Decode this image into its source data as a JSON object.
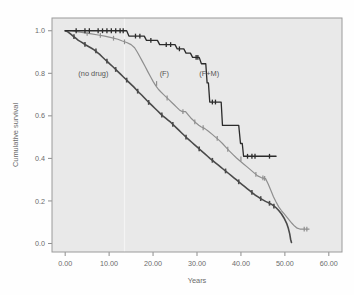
{
  "figure": {
    "background_color": "#fefefe",
    "plot_background_color": "#e9e9e9",
    "plot_border_color": "#9a9a9a"
  },
  "chart_data": {
    "type": "line",
    "title": "",
    "subtitle": "",
    "xlabel": "Years",
    "ylabel": "Cumulative survival",
    "xlim": [
      -3.0,
      63.0
    ],
    "ylim": [
      -0.04,
      1.06
    ],
    "grid": false,
    "legend_position": "inline-annotations",
    "xticks": [
      0,
      10,
      20,
      30,
      40,
      50,
      60
    ],
    "xtick_labels": [
      "0.00",
      "10.00",
      "20.00",
      "30.00",
      "40.00",
      "50.00",
      "60.00"
    ],
    "yticks": [
      0.0,
      0.2,
      0.4,
      0.6,
      0.8,
      1.0
    ],
    "ytick_labels": [
      "0.0",
      "0.2",
      "0.4",
      "0.6",
      "0.8",
      "1.0"
    ],
    "annotations": [
      {
        "text": "(no drug)",
        "x": 3.0,
        "y": 0.8,
        "color": "#555555"
      },
      {
        "text": "(F)",
        "x": 21.5,
        "y": 0.8,
        "color": "#555555"
      },
      {
        "text": "(F+M)",
        "x": 30.5,
        "y": 0.8,
        "color": "#555555"
      }
    ],
    "series": [
      {
        "name": "no drug",
        "label": "(no drug)",
        "color": "#4a4a4a",
        "line_width": 1.6,
        "censor_marks": true,
        "points": [
          [
            0.0,
            1.0
          ],
          [
            0.6,
            0.995
          ],
          [
            1.2,
            0.985
          ],
          [
            1.8,
            0.975
          ],
          [
            2.4,
            0.965
          ],
          [
            3.0,
            0.955
          ],
          [
            3.6,
            0.948
          ],
          [
            4.2,
            0.94
          ],
          [
            4.8,
            0.932
          ],
          [
            5.4,
            0.925
          ],
          [
            6.0,
            0.918
          ],
          [
            6.6,
            0.91
          ],
          [
            7.2,
            0.9
          ],
          [
            7.8,
            0.89
          ],
          [
            8.4,
            0.878
          ],
          [
            9.0,
            0.866
          ],
          [
            9.6,
            0.855
          ],
          [
            10.2,
            0.843
          ],
          [
            10.8,
            0.832
          ],
          [
            11.4,
            0.82
          ],
          [
            12.0,
            0.808
          ],
          [
            12.6,
            0.796
          ],
          [
            13.2,
            0.784
          ],
          [
            13.8,
            0.772
          ],
          [
            14.4,
            0.76
          ],
          [
            15.0,
            0.748
          ],
          [
            15.6,
            0.736
          ],
          [
            16.2,
            0.723
          ],
          [
            16.8,
            0.71
          ],
          [
            17.4,
            0.698
          ],
          [
            18.0,
            0.685
          ],
          [
            18.6,
            0.672
          ],
          [
            19.2,
            0.66
          ],
          [
            19.8,
            0.648
          ],
          [
            20.4,
            0.636
          ],
          [
            21.0,
            0.624
          ],
          [
            21.6,
            0.612
          ],
          [
            22.2,
            0.6
          ],
          [
            22.8,
            0.59
          ],
          [
            23.4,
            0.58
          ],
          [
            24.0,
            0.57
          ],
          [
            24.6,
            0.558
          ],
          [
            25.2,
            0.546
          ],
          [
            25.8,
            0.534
          ],
          [
            26.4,
            0.522
          ],
          [
            27.0,
            0.51
          ],
          [
            27.6,
            0.498
          ],
          [
            28.2,
            0.487
          ],
          [
            28.8,
            0.476
          ],
          [
            29.4,
            0.465
          ],
          [
            30.0,
            0.454
          ],
          [
            30.6,
            0.443
          ],
          [
            31.2,
            0.432
          ],
          [
            31.8,
            0.421
          ],
          [
            32.4,
            0.41
          ],
          [
            33.0,
            0.399
          ],
          [
            33.6,
            0.389
          ],
          [
            34.2,
            0.379
          ],
          [
            34.8,
            0.369
          ],
          [
            35.4,
            0.359
          ],
          [
            36.0,
            0.349
          ],
          [
            36.6,
            0.339
          ],
          [
            37.2,
            0.329
          ],
          [
            37.8,
            0.319
          ],
          [
            38.4,
            0.309
          ],
          [
            39.0,
            0.299
          ],
          [
            39.6,
            0.288
          ],
          [
            40.2,
            0.278
          ],
          [
            40.8,
            0.268
          ],
          [
            41.4,
            0.258
          ],
          [
            42.0,
            0.248
          ],
          [
            42.6,
            0.238
          ],
          [
            43.2,
            0.228
          ],
          [
            43.8,
            0.22
          ],
          [
            44.4,
            0.212
          ],
          [
            45.0,
            0.205
          ],
          [
            45.6,
            0.198
          ],
          [
            46.2,
            0.192
          ],
          [
            46.8,
            0.186
          ],
          [
            47.4,
            0.178
          ],
          [
            48.0,
            0.168
          ],
          [
            48.6,
            0.155
          ],
          [
            49.2,
            0.14
          ],
          [
            49.8,
            0.12
          ],
          [
            50.4,
            0.095
          ],
          [
            50.8,
            0.07
          ],
          [
            51.1,
            0.045
          ],
          [
            51.3,
            0.02
          ],
          [
            51.5,
            0.005
          ]
        ],
        "censor_points": [
          [
            2.0,
            0.972
          ],
          [
            4.5,
            0.936
          ],
          [
            7.0,
            0.905
          ],
          [
            9.5,
            0.857
          ],
          [
            11.5,
            0.818
          ],
          [
            14.0,
            0.768
          ],
          [
            16.5,
            0.716
          ],
          [
            19.0,
            0.663
          ],
          [
            22.0,
            0.604
          ],
          [
            24.5,
            0.56
          ],
          [
            27.5,
            0.5
          ],
          [
            30.5,
            0.445
          ],
          [
            33.5,
            0.391
          ],
          [
            36.5,
            0.341
          ],
          [
            39.5,
            0.29
          ],
          [
            42.5,
            0.24
          ],
          [
            44.5,
            0.211
          ],
          [
            46.5,
            0.189
          ],
          [
            47.5,
            0.176
          ]
        ]
      },
      {
        "name": "F",
        "label": "(F)",
        "color": "#8f8f8f",
        "line_width": 1.2,
        "censor_marks": true,
        "points": [
          [
            0.0,
            1.0
          ],
          [
            1.5,
            1.0
          ],
          [
            3.0,
            0.995
          ],
          [
            4.5,
            0.99
          ],
          [
            6.0,
            0.985
          ],
          [
            7.5,
            0.98
          ],
          [
            9.0,
            0.975
          ],
          [
            10.5,
            0.968
          ],
          [
            12.0,
            0.96
          ],
          [
            13.0,
            0.952
          ],
          [
            14.0,
            0.945
          ],
          [
            15.0,
            0.935
          ],
          [
            15.8,
            0.92
          ],
          [
            16.4,
            0.9
          ],
          [
            17.0,
            0.878
          ],
          [
            17.6,
            0.855
          ],
          [
            18.2,
            0.832
          ],
          [
            18.8,
            0.808
          ],
          [
            19.4,
            0.785
          ],
          [
            20.0,
            0.762
          ],
          [
            20.6,
            0.742
          ],
          [
            21.2,
            0.725
          ],
          [
            21.8,
            0.712
          ],
          [
            22.4,
            0.7
          ],
          [
            23.0,
            0.688
          ],
          [
            23.6,
            0.676
          ],
          [
            24.2,
            0.664
          ],
          [
            24.8,
            0.652
          ],
          [
            25.4,
            0.64
          ],
          [
            26.0,
            0.628
          ],
          [
            26.6,
            0.62
          ],
          [
            27.4,
            0.62
          ],
          [
            28.0,
            0.605
          ],
          [
            28.6,
            0.59
          ],
          [
            29.2,
            0.578
          ],
          [
            29.8,
            0.566
          ],
          [
            30.4,
            0.556
          ],
          [
            31.0,
            0.548
          ],
          [
            31.8,
            0.54
          ],
          [
            32.6,
            0.528
          ],
          [
            33.4,
            0.514
          ],
          [
            34.2,
            0.5
          ],
          [
            35.0,
            0.486
          ],
          [
            35.8,
            0.47
          ],
          [
            36.6,
            0.452
          ],
          [
            37.4,
            0.434
          ],
          [
            38.2,
            0.418
          ],
          [
            39.0,
            0.402
          ],
          [
            39.8,
            0.388
          ],
          [
            40.6,
            0.374
          ],
          [
            41.4,
            0.36
          ],
          [
            42.2,
            0.346
          ],
          [
            43.0,
            0.332
          ],
          [
            43.8,
            0.318
          ],
          [
            44.6,
            0.31
          ],
          [
            45.6,
            0.305
          ],
          [
            46.2,
            0.28
          ],
          [
            46.8,
            0.25
          ],
          [
            47.4,
            0.22
          ],
          [
            48.0,
            0.195
          ],
          [
            48.6,
            0.172
          ],
          [
            49.2,
            0.155
          ],
          [
            49.8,
            0.14
          ],
          [
            50.4,
            0.125
          ],
          [
            51.0,
            0.11
          ],
          [
            51.6,
            0.095
          ],
          [
            52.2,
            0.082
          ],
          [
            52.8,
            0.072
          ],
          [
            53.4,
            0.068
          ],
          [
            55.5,
            0.068
          ]
        ],
        "censor_points": [
          [
            5.0,
            0.988
          ],
          [
            8.0,
            0.978
          ],
          [
            11.0,
            0.965
          ],
          [
            13.5,
            0.948
          ],
          [
            20.8,
            0.752
          ],
          [
            23.2,
            0.684
          ],
          [
            26.8,
            0.62
          ],
          [
            29.5,
            0.572
          ],
          [
            31.4,
            0.544
          ],
          [
            34.6,
            0.494
          ],
          [
            37.0,
            0.443
          ],
          [
            40.0,
            0.398
          ],
          [
            43.4,
            0.325
          ],
          [
            45.0,
            0.308
          ],
          [
            45.4,
            0.306
          ],
          [
            54.4,
            0.068
          ],
          [
            55.0,
            0.068
          ]
        ]
      },
      {
        "name": "F+M",
        "label": "(F+M)",
        "color": "#2b2b2b",
        "line_width": 1.3,
        "censor_marks": true,
        "points": [
          [
            0.0,
            1.0
          ],
          [
            14.0,
            1.0
          ],
          [
            14.5,
            0.975
          ],
          [
            18.0,
            0.975
          ],
          [
            18.5,
            0.955
          ],
          [
            21.0,
            0.955
          ],
          [
            21.5,
            0.935
          ],
          [
            25.0,
            0.935
          ],
          [
            25.5,
            0.915
          ],
          [
            27.0,
            0.915
          ],
          [
            27.5,
            0.895
          ],
          [
            28.5,
            0.895
          ],
          [
            29.0,
            0.875
          ],
          [
            30.5,
            0.875
          ],
          [
            31.0,
            0.845
          ],
          [
            32.0,
            0.845
          ],
          [
            32.3,
            0.755
          ],
          [
            32.6,
            0.755
          ],
          [
            32.9,
            0.665
          ],
          [
            35.5,
            0.665
          ],
          [
            35.8,
            0.555
          ],
          [
            39.5,
            0.555
          ],
          [
            39.9,
            0.47
          ],
          [
            40.3,
            0.47
          ],
          [
            40.6,
            0.41
          ],
          [
            48.0,
            0.41
          ]
        ],
        "censor_points": [
          [
            2.5,
            1.0
          ],
          [
            4.5,
            1.0
          ],
          [
            5.5,
            1.0
          ],
          [
            7.5,
            1.0
          ],
          [
            8.5,
            1.0
          ],
          [
            9.5,
            1.0
          ],
          [
            10.5,
            1.0
          ],
          [
            11.5,
            1.0
          ],
          [
            12.5,
            1.0
          ],
          [
            13.2,
            1.0
          ],
          [
            16.0,
            0.975
          ],
          [
            17.0,
            0.975
          ],
          [
            19.5,
            0.955
          ],
          [
            23.0,
            0.935
          ],
          [
            24.0,
            0.935
          ],
          [
            26.0,
            0.915
          ],
          [
            29.8,
            0.875
          ],
          [
            30.2,
            0.875
          ],
          [
            33.5,
            0.665
          ],
          [
            34.2,
            0.665
          ],
          [
            41.5,
            0.41
          ],
          [
            42.5,
            0.41
          ],
          [
            43.2,
            0.41
          ],
          [
            46.5,
            0.41
          ]
        ]
      }
    ]
  }
}
